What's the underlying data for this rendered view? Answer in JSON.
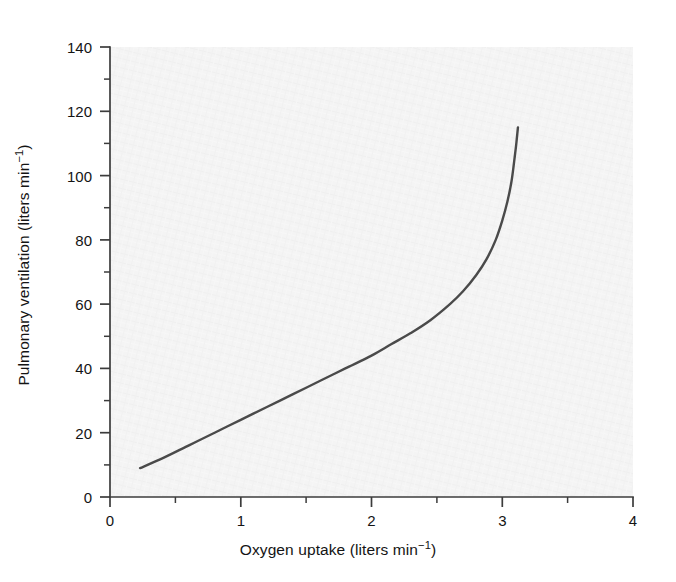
{
  "figure": {
    "background_color": "#ffffff",
    "plot_background_color": "#f4f4f4",
    "curve_color": "#4a4a4a",
    "axis_color": "#3c3c3c"
  },
  "axes": {
    "x": {
      "label_prefix": "Oxygen uptake (liters min",
      "label_exponent": "−1",
      "label_suffix": ")",
      "label_full": "Oxygen uptake (liters min⁻¹)",
      "min": 0,
      "max": 4,
      "major_ticks": [
        0,
        1,
        2,
        3,
        4
      ],
      "major_tick_labels": [
        "0",
        "1",
        "2",
        "3",
        "4"
      ],
      "minor_ticks": [
        0.5,
        1.5,
        2.5,
        3.5
      ]
    },
    "y": {
      "label_prefix": "Pulmonary ventilation (liters min",
      "label_exponent": "−1",
      "label_suffix": ")",
      "label_full": "Pulmonary ventilation (liters min⁻¹)",
      "min": 0,
      "max": 140,
      "major_ticks": [
        0,
        20,
        40,
        60,
        80,
        100,
        120,
        140
      ],
      "major_tick_labels": [
        "0",
        "20",
        "40",
        "60",
        "80",
        "100",
        "120",
        "140"
      ],
      "minor_ticks": [
        10,
        30,
        50,
        70,
        90,
        110,
        130
      ]
    }
  },
  "caption": {
    "partial_text": ""
  },
  "chart_data": {
    "type": "line",
    "title": "",
    "subtitle": "",
    "xlabel": "Oxygen uptake (liters min⁻¹)",
    "ylabel": "Pulmonary ventilation (liters min⁻¹)",
    "xlim": [
      0,
      4
    ],
    "ylim": [
      0,
      140
    ],
    "grid": false,
    "legend": false,
    "legend_position": "none",
    "series": [
      {
        "name": "Pulmonary ventilation vs oxygen uptake",
        "color": "#4a4a4a",
        "line_width": 2.4,
        "x": [
          0.23,
          0.4,
          0.6,
          0.8,
          1.0,
          1.2,
          1.4,
          1.6,
          1.8,
          2.0,
          2.15,
          2.3,
          2.45,
          2.6,
          2.7,
          2.8,
          2.88,
          2.95,
          3.0,
          3.04,
          3.07,
          3.09,
          3.105,
          3.115,
          3.12
        ],
        "y": [
          9,
          12,
          16,
          20,
          24,
          28,
          32,
          36,
          40,
          44,
          47.5,
          51,
          55,
          60,
          64,
          69,
          74,
          80,
          86,
          92,
          98,
          104,
          109,
          113,
          115
        ]
      }
    ],
    "annotations": []
  }
}
